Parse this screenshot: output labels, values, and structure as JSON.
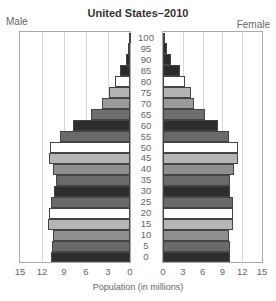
{
  "chart_data": {
    "type": "bar",
    "orientation": "horizontal",
    "subtype": "population-pyramid",
    "title": "United States–2010",
    "xlabel": "Population (in millions)",
    "ylabel": "",
    "left_label": "Male",
    "right_label": "Female",
    "xlim": [
      0,
      15
    ],
    "x_ticks_left": [
      "15",
      "12",
      "9",
      "6",
      "3",
      "0"
    ],
    "x_ticks_right": [
      "0",
      "3",
      "6",
      "9",
      "12",
      "15"
    ],
    "grid": true,
    "age_labels": [
      "100",
      "95",
      "90",
      "85",
      "80",
      "75",
      "70",
      "65",
      "60",
      "55",
      "50",
      "45",
      "40",
      "35",
      "30",
      "25",
      "20",
      "15",
      "10",
      "5",
      "0"
    ],
    "categories": [
      "100+",
      "95-99",
      "90-94",
      "85-89",
      "80-84",
      "75-79",
      "70-74",
      "65-69",
      "60-64",
      "55-59",
      "50-54",
      "45-49",
      "40-44",
      "35-39",
      "30-34",
      "25-29",
      "20-24",
      "15-19",
      "10-14",
      "5-9",
      "0-4"
    ],
    "series": [
      {
        "name": "Male",
        "values": [
          0.1,
          0.3,
          0.6,
          1.3,
          2.0,
          2.8,
          3.8,
          5.3,
          7.8,
          9.5,
          10.9,
          11.1,
          10.5,
          10.1,
          10.3,
          10.8,
          11.0,
          11.2,
          10.5,
          10.6,
          10.8
        ]
      },
      {
        "name": "Female",
        "values": [
          0.1,
          0.6,
          1.2,
          2.5,
          3.4,
          4.2,
          4.7,
          6.3,
          8.3,
          10.0,
          11.3,
          11.4,
          10.8,
          10.2,
          10.2,
          10.6,
          10.6,
          10.6,
          10.0,
          10.1,
          10.2
        ]
      }
    ],
    "bar_colors": [
      "#2a2a2a",
      "#2a2a2a",
      "#2a2a2a",
      "#2a2a2a",
      "#ffffff",
      "#b3b3b3",
      "#9a9a9a",
      "#6f6f6f",
      "#2e2e2e",
      "#6a6a6a",
      "#ffffff",
      "#b5b5b5",
      "#8f8f8f",
      "#6a6a6a",
      "#2e2e2e",
      "#6a6a6a",
      "#ffffff",
      "#b5b5b5",
      "#8f8f8f",
      "#6a6a6a",
      "#2e2e2e"
    ]
  }
}
